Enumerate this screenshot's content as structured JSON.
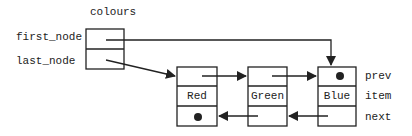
{
  "diagram": {
    "type": "doubly-linked-list",
    "list_name": "colours",
    "list_fields": [
      "first_node",
      "last_node"
    ],
    "node_fields": {
      "prev": "prev",
      "item": "item",
      "next": "next"
    },
    "nodes": [
      {
        "item": "Red",
        "prev": "null",
        "next": "Green"
      },
      {
        "item": "Green",
        "prev": "Red",
        "next": "Blue"
      },
      {
        "item": "Blue",
        "prev": "Green",
        "next": "null"
      }
    ],
    "pointers": {
      "first_node": "Blue",
      "last_node": "Red"
    },
    "colors": {
      "line": "#222222",
      "background": "#ffffff"
    }
  }
}
